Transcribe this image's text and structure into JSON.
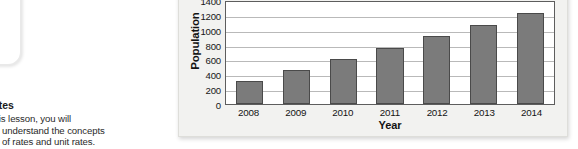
{
  "left_column": {
    "objective_heading": "ates",
    "objective_lines": [
      "this lesson, you will",
      "understand the concepts",
      "of rates and unit rates."
    ]
  },
  "chart_data": {
    "type": "bar",
    "title": "",
    "xlabel": "Year",
    "ylabel": "Population",
    "categories": [
      "2008",
      "2009",
      "2010",
      "2011",
      "2012",
      "2013",
      "2014"
    ],
    "values": [
      310,
      460,
      610,
      760,
      920,
      1070,
      1220
    ],
    "ylim": [
      0,
      1400
    ],
    "ytick_labels": [
      "0",
      "200",
      "400",
      "600",
      "800",
      "1000",
      "1200",
      "1400"
    ],
    "ytick_values": [
      0,
      200,
      400,
      600,
      800,
      1000,
      1200,
      1400
    ],
    "grid": true,
    "legend": "none",
    "bar_color": "#7b7b7b",
    "bar_border_color": "#4a4a4a",
    "plot_background": "#ffffff",
    "panel_background": "#f2f2f0",
    "gridline_color": "#b9b9b9",
    "axis_color": "#5d5d5d"
  }
}
